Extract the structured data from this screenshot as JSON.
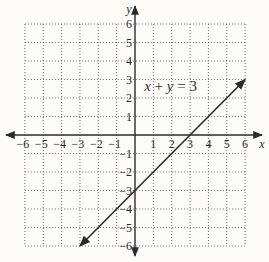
{
  "chart_data": {
    "type": "line",
    "title": "",
    "xlabel": "x",
    "ylabel": "y",
    "xlim": [
      -6,
      6
    ],
    "ylim": [
      -6,
      6
    ],
    "grid": true,
    "grid_style": "dotted",
    "x_ticks": [
      -6,
      -5,
      -4,
      -3,
      -2,
      -1,
      1,
      2,
      3,
      4,
      5,
      6
    ],
    "y_ticks": [
      -6,
      -5,
      -4,
      -3,
      -2,
      -1,
      1,
      2,
      3,
      4,
      5,
      6
    ],
    "x_tick_labels": [
      "−6",
      "−5",
      "−4",
      "−3",
      "−2",
      "−1",
      "1",
      "2",
      "3",
      "4",
      "5",
      "6"
    ],
    "y_tick_labels": [
      "−6",
      "−5",
      "−4",
      "−3",
      "−2",
      "−1",
      "1",
      "2",
      "3",
      "4",
      "5",
      "6"
    ],
    "series": [
      {
        "name": "x + y = 3",
        "x": [
          -3,
          0,
          3,
          6
        ],
        "y": [
          -6,
          -3,
          0,
          3
        ],
        "arrows": "both",
        "color": "#2b2b2b"
      }
    ],
    "annotations": [
      {
        "text": "x + y = 3",
        "x": 0.5,
        "y": 2.4
      }
    ]
  },
  "colors": {
    "background": "#fdfcf8",
    "axis": "#2b2b2b",
    "grid": "#6a6a6a",
    "line": "#2b2b2b",
    "text": "#2a2a2a"
  }
}
